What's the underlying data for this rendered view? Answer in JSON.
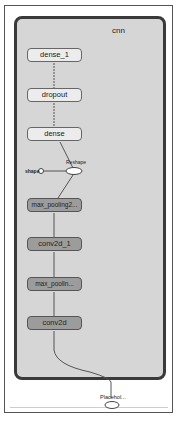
{
  "group": {
    "label": "cnn"
  },
  "nodes": {
    "dense_1": "dense_1",
    "dropout": "dropout",
    "dense": "dense",
    "max_pooling2": "max_pooling2...",
    "conv2d_1": "conv2d_1",
    "max_poolin": "max_poolin...",
    "conv2d": "conv2d"
  },
  "ops": {
    "reshape": "Reshape",
    "shape": "shape",
    "placeholder": "Placehol..."
  },
  "colors": {
    "group_fill": "#d6d6d6",
    "group_border": "#3a3a3a",
    "light_node": "#ececec",
    "dark_node": "#9c9c9c"
  }
}
